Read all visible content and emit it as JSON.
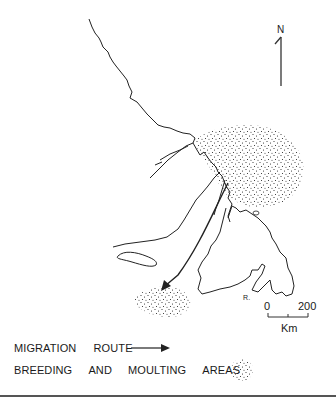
{
  "map": {
    "north_label": "N",
    "scale": {
      "start": "0",
      "end": "200",
      "unit": "Km"
    },
    "small_label": "R."
  },
  "legend": {
    "migration_route": {
      "words": [
        "MIGRATION",
        "ROUTE"
      ],
      "symbol": "arrow-icon"
    },
    "breeding_areas": {
      "words": [
        "BREEDING",
        "AND",
        "MOULTING",
        "AREAS"
      ],
      "symbol": "stipple-icon"
    }
  },
  "colors": {
    "ink": "#1a1a1a",
    "background": "#ffffff",
    "rule": "#555555"
  }
}
